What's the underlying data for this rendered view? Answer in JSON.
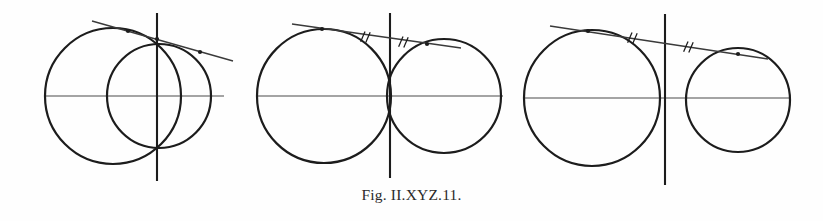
{
  "figure": {
    "caption": "Fig. II.XYZ.11.",
    "background_color": "#fefefe",
    "ink_color": "#1c1c1c",
    "axis_color": "#4a4a4a",
    "line_color": "#3a3a3a",
    "width": 823,
    "height": 221,
    "panel_count": 3
  },
  "chart_data": {
    "type": "diagram",
    "title": "Fig. II.XYZ.11.",
    "xlabel": "",
    "ylabel": "",
    "panels": [
      {
        "id": "panel-1",
        "label": "intersecting-circles",
        "axes": {
          "horizontal": {
            "x1": 44,
            "y1": 96,
            "x2": 224,
            "y2": 96
          },
          "vertical": {
            "x1": 157,
            "y1": 13,
            "x2": 157,
            "y2": 181
          }
        },
        "circles": [
          {
            "name": "left-circle",
            "cx": 113,
            "cy": 96,
            "r": 68
          },
          {
            "name": "right-circle",
            "cx": 159,
            "cy": 96,
            "r": 52
          }
        ],
        "line": {
          "name": "transversal",
          "x1": 92,
          "y1": 21,
          "x2": 233,
          "y2": 61
        },
        "points": [
          {
            "name": "point-a",
            "x": 128,
            "y": 31
          },
          {
            "name": "point-b",
            "x": 157,
            "y": 39
          },
          {
            "name": "point-c",
            "x": 200,
            "y": 52
          }
        ],
        "tick_marks": []
      },
      {
        "id": "panel-2",
        "label": "tangent-circles-on-axis",
        "axes": {
          "horizontal": {
            "x1": 257,
            "y1": 96,
            "x2": 503,
            "y2": 96
          },
          "vertical": {
            "x1": 390,
            "y1": 13,
            "x2": 390,
            "y2": 178
          }
        },
        "circles": [
          {
            "name": "left-circle",
            "cx": 324,
            "cy": 96,
            "r": 67
          },
          {
            "name": "right-circle",
            "cx": 444,
            "cy": 96,
            "r": 57
          }
        ],
        "line": {
          "name": "common-tangent",
          "x1": 292,
          "y1": 24,
          "x2": 461,
          "y2": 48
        },
        "points": [
          {
            "name": "tangency-left",
            "x": 322,
            "y": 29
          },
          {
            "name": "tangency-right",
            "x": 427,
            "y": 44
          }
        ],
        "tick_marks": [
          {
            "name": "tick-left",
            "x": 365,
            "y": 37,
            "glyph": "double-slash"
          },
          {
            "name": "tick-right",
            "x": 403,
            "y": 42,
            "glyph": "double-slash"
          }
        ]
      },
      {
        "id": "panel-3",
        "label": "separated-circles-common-tangent",
        "axes": {
          "horizontal": {
            "x1": 523,
            "y1": 98,
            "x2": 790,
            "y2": 98
          },
          "vertical": {
            "x1": 665,
            "y1": 14,
            "x2": 665,
            "y2": 185
          }
        },
        "circles": [
          {
            "name": "left-circle",
            "cx": 592,
            "cy": 98,
            "r": 68
          },
          {
            "name": "right-circle",
            "cx": 738,
            "cy": 100,
            "r": 52
          }
        ],
        "line": {
          "name": "common-tangent",
          "x1": 550,
          "y1": 26,
          "x2": 768,
          "y2": 59
        },
        "points": [
          {
            "name": "tangency-left",
            "x": 588,
            "y": 31
          },
          {
            "name": "tangency-right",
            "x": 738,
            "y": 54
          }
        ],
        "tick_marks": [
          {
            "name": "tick-left",
            "x": 632,
            "y": 38,
            "glyph": "double-slash"
          },
          {
            "name": "tick-right",
            "x": 688,
            "y": 47,
            "glyph": "double-slash"
          }
        ]
      }
    ]
  }
}
